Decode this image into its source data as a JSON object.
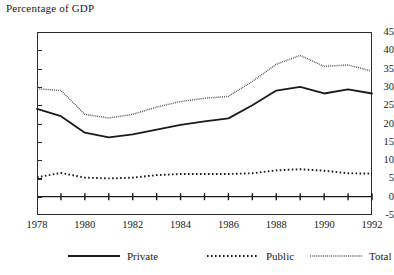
{
  "chart_data": {
    "type": "line",
    "title": "Percentage of GDP",
    "xlabel": "",
    "ylabel": "",
    "ylim": [
      -5,
      45
    ],
    "ytick_values": [
      45,
      40,
      35,
      30,
      25,
      20,
      15,
      10,
      5,
      0,
      -5
    ],
    "ytick_labels": [
      "45",
      "40",
      "35",
      "30",
      "25",
      "20",
      "15",
      "10",
      "5",
      "0",
      "-5"
    ],
    "xlim": [
      1978,
      1992
    ],
    "x": [
      1978,
      1979,
      1980,
      1981,
      1982,
      1983,
      1984,
      1985,
      1986,
      1987,
      1988,
      1989,
      1990,
      1991,
      1992
    ],
    "xtick_labels": [
      "1978",
      "1980",
      "1982",
      "1984",
      "1986",
      "1988",
      "1990",
      "1992"
    ],
    "xtick_values": [
      1978,
      1980,
      1982,
      1984,
      1986,
      1988,
      1990,
      1992
    ],
    "grid": false,
    "zero_line": true,
    "legend_position": "bottom",
    "series": [
      {
        "name": "Private",
        "style": "solid",
        "color": "#1a1a1a",
        "values": [
          24.0,
          22.0,
          17.5,
          16.2,
          17.0,
          18.3,
          19.6,
          20.6,
          21.4,
          25.0,
          29.0,
          30.0,
          28.2,
          29.3,
          28.2
        ]
      },
      {
        "name": "Public",
        "style": "dotted",
        "color": "#1a1a1a",
        "values": [
          5.3,
          6.5,
          5.2,
          5.0,
          5.2,
          5.9,
          6.2,
          6.2,
          6.2,
          6.4,
          7.2,
          7.5,
          7.1,
          6.4,
          6.3
        ]
      },
      {
        "name": "Total",
        "style": "fine-dotted",
        "color": "#555555",
        "values": [
          29.5,
          29.0,
          22.5,
          21.5,
          22.5,
          24.5,
          26.0,
          26.9,
          27.4,
          31.5,
          36.2,
          38.6,
          35.6,
          36.0,
          34.3
        ]
      }
    ]
  },
  "legend": {
    "items": [
      {
        "label": "Private",
        "style": "solid"
      },
      {
        "label": "Public",
        "style": "dotted"
      },
      {
        "label": "Total",
        "style": "fine-dotted"
      }
    ]
  }
}
